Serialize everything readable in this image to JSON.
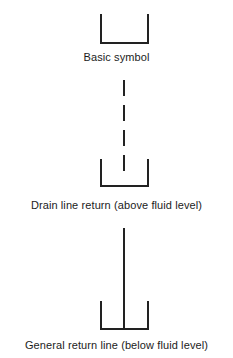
{
  "diagram": {
    "background_color": "#ffffff",
    "line_color": "#222222",
    "line_width": 2,
    "figures": [
      {
        "id": "basic-symbol",
        "name": "basic-symbol",
        "caption": "Basic symbol",
        "reservoir": {
          "x1": 101,
          "x2": 148,
          "top": 15,
          "bottom": 43
        },
        "pipe": null
      },
      {
        "id": "drain-line-return",
        "name": "drain-line-return-symbol",
        "caption": "Drain line return (above fluid level)",
        "reservoir": {
          "x1": 101,
          "x2": 148,
          "top": 160,
          "bottom": 186
        },
        "pipe": {
          "style": "dashed",
          "x": 124,
          "top": 80,
          "bottom": 176,
          "dash": 16,
          "gap": 9
        }
      },
      {
        "id": "general-return-line",
        "name": "general-return-line-symbol",
        "caption": "General return line (below fluid level)",
        "reservoir": {
          "x1": 101,
          "x2": 148,
          "top": 302,
          "bottom": 329
        },
        "pipe": {
          "style": "solid",
          "x": 124,
          "top": 228,
          "bottom": 329,
          "dash": 0,
          "gap": 0
        }
      }
    ]
  }
}
